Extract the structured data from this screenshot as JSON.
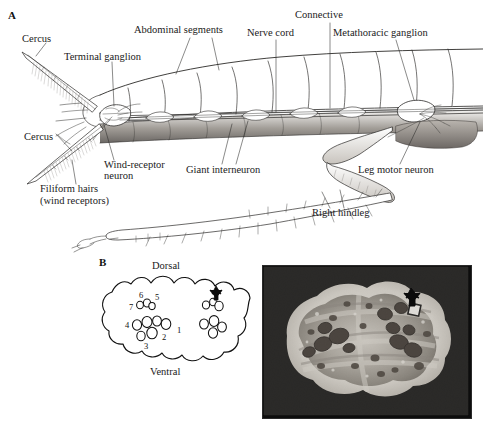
{
  "figure": {
    "width": 483,
    "height": 427,
    "background": "#ffffff",
    "ink": "#1a1a1a"
  },
  "panel_a": {
    "letter": "A",
    "caption_subject": "cockroach-abdomen-lateral-cutaway",
    "labels": [
      {
        "id": "cercus-upper",
        "text": "Cercus",
        "x": 22,
        "y": 38,
        "leader": true
      },
      {
        "id": "terminal-ganglion",
        "text": "Terminal ganglion",
        "x": 64,
        "y": 56,
        "leader": true
      },
      {
        "id": "abdominal-segments",
        "text": "Abdominal segments",
        "x": 134,
        "y": 29,
        "leader": true
      },
      {
        "id": "nerve-cord",
        "text": "Nerve cord",
        "x": 247,
        "y": 32,
        "leader": true
      },
      {
        "id": "connective",
        "text": "Connective",
        "x": 295,
        "y": 14,
        "leader": true
      },
      {
        "id": "metathoracic-ganglion",
        "text": "Metathoracic ganglion",
        "x": 333,
        "y": 32,
        "leader": true
      },
      {
        "id": "cercus-lower",
        "text": "Cercus",
        "x": 24,
        "y": 136,
        "leader": true
      },
      {
        "id": "wind-receptor-neuron",
        "text": "Wind-receptor",
        "x": 104,
        "y": 164,
        "leader": true
      },
      {
        "id": "wind-receptor-neuron-2",
        "text": "neuron",
        "x": 104,
        "y": 175,
        "leader": false
      },
      {
        "id": "filiform-hairs",
        "text": "Filiform hairs",
        "x": 40,
        "y": 188,
        "leader": true
      },
      {
        "id": "filiform-hairs-2",
        "text": "(wind receptors)",
        "x": 40,
        "y": 200,
        "leader": false
      },
      {
        "id": "giant-interneuron",
        "text": "Giant interneuron",
        "x": 186,
        "y": 169,
        "leader": true
      },
      {
        "id": "leg-motor-neuron",
        "text": "Leg motor neuron",
        "x": 358,
        "y": 169,
        "leader": true
      },
      {
        "id": "right-hindleg",
        "text": "Right hindleg",
        "x": 312,
        "y": 212,
        "leader": true
      }
    ]
  },
  "panel_b": {
    "letter": "B",
    "diagram": {
      "title_subject": "terminal-ganglion-cross-section-schematic",
      "orientation_labels": [
        {
          "id": "dorsal",
          "text": "Dorsal",
          "x": 152,
          "y": 265
        },
        {
          "id": "ventral",
          "text": "Ventral",
          "x": 150,
          "y": 370
        }
      ],
      "giant_interneuron_numbers": [
        "1",
        "2",
        "3",
        "4",
        "5",
        "6",
        "7"
      ],
      "number_positions": [
        {
          "label": "1",
          "x": 178,
          "y": 330
        },
        {
          "label": "2",
          "x": 164,
          "y": 336
        },
        {
          "label": "3",
          "x": 148,
          "y": 345
        },
        {
          "label": "4",
          "x": 128,
          "y": 325
        },
        {
          "label": "5",
          "x": 158,
          "y": 297
        },
        {
          "label": "6",
          "x": 142,
          "y": 296
        },
        {
          "label": "7",
          "x": 132,
          "y": 308
        }
      ],
      "marker": "arrow-pointing-to-right-cluster"
    },
    "micrograph": {
      "type": "electron-micrograph",
      "subject": "nerve-cord-cross-section",
      "marker": "arrow-pointing-to-stained-axon",
      "x": 262,
      "y": 265,
      "width": 208,
      "height": 152
    }
  }
}
